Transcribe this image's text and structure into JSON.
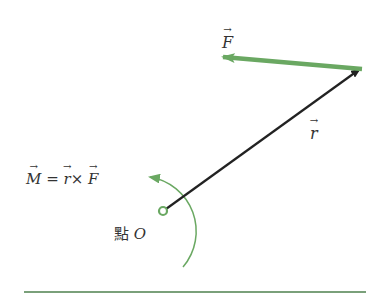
{
  "diagram": {
    "labels": {
      "force": "F",
      "radius": "r",
      "moment_lhs": "M",
      "equals": "=",
      "moment_r": "r",
      "cross": "×",
      "moment_f": "F",
      "point_prefix": "點",
      "point_name": "O"
    },
    "colors": {
      "green": "#6aa862",
      "black": "#222222",
      "text": "#333333"
    }
  }
}
